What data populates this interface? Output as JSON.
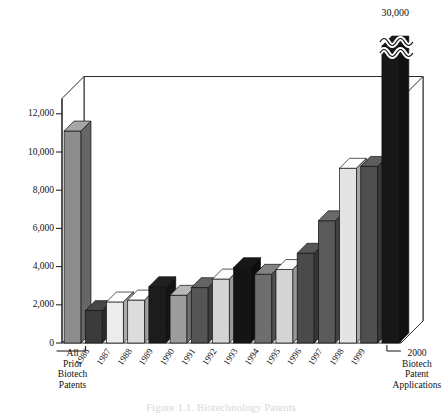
{
  "chart_data": {
    "type": "bar",
    "title": "",
    "xlabel": "",
    "ylabel": "",
    "ylim": [
      0,
      13000
    ],
    "grid": true,
    "legend": "none",
    "y_ticks": [
      "0",
      "2,000",
      "4,000",
      "6,000",
      "8,000",
      "10,000",
      "12,000"
    ],
    "y_tick_values": [
      0,
      2000,
      4000,
      6000,
      8000,
      10000,
      12000
    ],
    "categories": [
      "All Prior Biotech Patents",
      "1986",
      "1987",
      "1988",
      "1989",
      "1990",
      "1991",
      "1992",
      "1993",
      "1994",
      "1995",
      "1996",
      "1997",
      "1998",
      "1999",
      "2000 Biotech Patent Applications"
    ],
    "values": [
      11100,
      1700,
      2150,
      2250,
      2950,
      2500,
      2900,
      3350,
      3950,
      3600,
      3850,
      4700,
      6400,
      9150,
      9250,
      30000
    ],
    "bars": [
      {
        "category": "All Prior Biotech Patents",
        "value": 11100,
        "fill": "#8d8d8d",
        "broken": false
      },
      {
        "category": "1986",
        "value": 1700,
        "fill": "#3b3b3b",
        "broken": false
      },
      {
        "category": "1987",
        "value": 2150,
        "fill": "#ececec",
        "broken": false
      },
      {
        "category": "1988",
        "value": 2250,
        "fill": "#dcdcdc",
        "broken": false
      },
      {
        "category": "1989",
        "value": 2950,
        "fill": "#1c1c1c",
        "broken": false
      },
      {
        "category": "1990",
        "value": 2500,
        "fill": "#9c9c9c",
        "broken": false
      },
      {
        "category": "1991",
        "value": 2900,
        "fill": "#555555",
        "broken": false
      },
      {
        "category": "1992",
        "value": 3350,
        "fill": "#d4d4d4",
        "broken": false
      },
      {
        "category": "1993",
        "value": 3950,
        "fill": "#141414",
        "broken": false
      },
      {
        "category": "1994",
        "value": 3600,
        "fill": "#6e6e6e",
        "broken": false
      },
      {
        "category": "1995",
        "value": 3850,
        "fill": "#d4d4d4",
        "broken": false
      },
      {
        "category": "1996",
        "value": 4700,
        "fill": "#4a4a4a",
        "broken": false
      },
      {
        "category": "1997",
        "value": 6400,
        "fill": "#5a5a5a",
        "broken": false
      },
      {
        "category": "1998",
        "value": 9150,
        "fill": "#e4e4e4",
        "broken": false
      },
      {
        "category": "1999",
        "value": 9250,
        "fill": "#4f4f4f",
        "broken": false
      },
      {
        "category": "2000 Biotech Patent Applications",
        "value": 30000,
        "fill": "#171717",
        "broken": true
      }
    ],
    "annotations": [
      {
        "text": "30,000",
        "for": "2000 Biotech Patent Applications",
        "note": "axis-break value label above bar"
      }
    ],
    "axis_break": {
      "present": true,
      "for": "2000 Biotech Patent Applications",
      "style": "wavy-double-line"
    }
  },
  "axis": {
    "y_labels": [
      "12,000",
      "10,000",
      "8,000",
      "6,000",
      "4,000",
      "2,000",
      "0"
    ],
    "x_year_labels": [
      "1986",
      "1987",
      "1988",
      "1989",
      "1990",
      "1991",
      "1992",
      "1993",
      "1994",
      "1995",
      "1996",
      "1997",
      "1998",
      "1999"
    ]
  },
  "groups": {
    "left": {
      "lines": [
        "All",
        "Prior",
        "Biotech",
        "Patents"
      ]
    },
    "right": {
      "lines": [
        "2000",
        "Biotech",
        "Patent",
        "Applications"
      ]
    }
  },
  "labels": {
    "break_value": "30,000"
  },
  "caption": {
    "text": "Figure 1.1. Biotechnology Patents"
  },
  "colors": {
    "background": "#ffffff",
    "axis": "#2a2a2a",
    "grid": "#9a9a9a",
    "text": "#111111"
  }
}
